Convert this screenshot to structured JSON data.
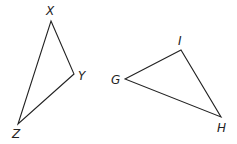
{
  "diagram": {
    "triangles": [
      {
        "name": "XYZ",
        "vertices": [
          {
            "label": "X",
            "x": 51,
            "y": 21,
            "lx": 46,
            "ly": 15
          },
          {
            "label": "Y",
            "x": 74,
            "y": 74,
            "lx": 78,
            "ly": 80
          },
          {
            "label": "Z",
            "x": 18,
            "y": 124,
            "lx": 12,
            "ly": 138
          }
        ]
      },
      {
        "name": "GIH",
        "vertices": [
          {
            "label": "G",
            "x": 125,
            "y": 79,
            "lx": 111,
            "ly": 84
          },
          {
            "label": "I",
            "x": 181,
            "y": 50,
            "lx": 178,
            "ly": 45
          },
          {
            "label": "H",
            "x": 221,
            "y": 117,
            "lx": 217,
            "ly": 132
          }
        ]
      }
    ],
    "stroke_color": "#222222",
    "background": "#ffffff"
  }
}
